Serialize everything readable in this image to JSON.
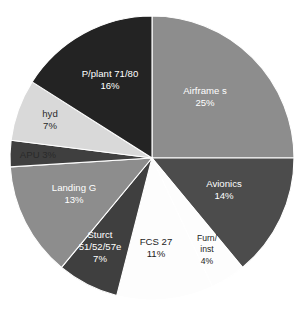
{
  "chart_data": {
    "type": "pie",
    "title": "",
    "subtitle": "",
    "xlabel": "",
    "ylabel": "",
    "legend_position": "none",
    "grid": false,
    "value_unit": "percent",
    "start_angle_deg": 0,
    "direction": "clockwise",
    "categories": [
      "Airframe s",
      "Avionics",
      "Furn/ inst",
      "FCS 27",
      "Sturct 51/52/57e",
      "Landing G",
      "APU",
      "hyd",
      "P/plant 71/80"
    ],
    "values": [
      25,
      14,
      4,
      11,
      7,
      13,
      3,
      7,
      16
    ],
    "slices": [
      {
        "name": "airframe-s",
        "label_lines": [
          "Airframe s",
          "25%"
        ],
        "value": 25,
        "value_label": "25%",
        "color": "#8d8d8d",
        "text_color": "#ffffff",
        "label_x": 205,
        "label_y": 97,
        "line_height": 12.5,
        "size": "normal"
      },
      {
        "name": "avionics",
        "label_lines": [
          "Avionics",
          "14%"
        ],
        "value": 14,
        "value_label": "14%",
        "color": "#4c4c4c",
        "text_color": "#ffffff",
        "label_x": 224,
        "label_y": 190,
        "line_height": 12.5,
        "size": "normal"
      },
      {
        "name": "furn-inst",
        "label_lines": [
          "Furn/",
          "inst",
          "4%"
        ],
        "value": 4,
        "value_label": "4%",
        "color": "#fdfdfd",
        "text_color": "#1c1c1c",
        "label_x": 207,
        "label_y": 250,
        "line_height": 11.5,
        "size": "small"
      },
      {
        "name": "fcs-27",
        "label_lines": [
          "FCS 27",
          "11%"
        ],
        "value": 11,
        "value_label": "11%",
        "color": "#fdfdfd",
        "text_color": "#1c1c1c",
        "label_x": 156,
        "label_y": 248,
        "line_height": 12.5,
        "size": "normal"
      },
      {
        "name": "sturct-51-52-57e",
        "label_lines": [
          "Sturct",
          "51/52/57e",
          "7%"
        ],
        "value": 7,
        "value_label": "7%",
        "color": "#3f3f3f",
        "text_color": "#ffffff",
        "label_x": 100,
        "label_y": 247,
        "line_height": 12.0,
        "size": "normal"
      },
      {
        "name": "landing-g",
        "label_lines": [
          "Landing G",
          "13%"
        ],
        "value": 13,
        "value_label": "13%",
        "color": "#8d8d8d",
        "text_color": "#ffffff",
        "label_x": 74,
        "label_y": 194,
        "line_height": 12.5,
        "size": "normal"
      },
      {
        "name": "apu",
        "label_lines": [
          "APU 3%"
        ],
        "value": 3,
        "value_label": "3%",
        "color": "#3f3f3f",
        "text_color": "#2a2a2a",
        "label_x": 38,
        "label_y": 155,
        "line_height": 12.5,
        "size": "normal"
      },
      {
        "name": "hyd",
        "label_lines": [
          "hyd",
          "7%"
        ],
        "value": 7,
        "value_label": "7%",
        "color": "#d9d9d9",
        "text_color": "#2a2a2a",
        "label_x": 50,
        "label_y": 120,
        "line_height": 12.5,
        "size": "normal"
      },
      {
        "name": "p-plant-71-80",
        "label_lines": [
          "P/plant 71/80",
          "16%"
        ],
        "value": 16,
        "value_label": "16%",
        "color": "#232323",
        "text_color": "#ffffff",
        "label_x": 110,
        "label_y": 80,
        "line_height": 12.5,
        "size": "normal"
      }
    ],
    "geometry": {
      "cx": 152,
      "cy": 158,
      "r": 142
    }
  }
}
